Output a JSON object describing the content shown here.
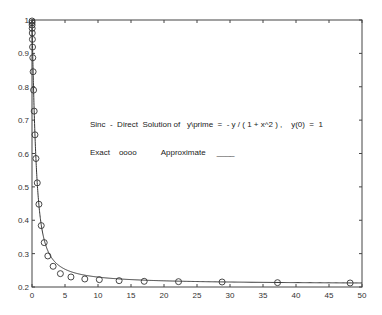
{
  "chart_data": {
    "type": "line",
    "title": "",
    "xlabel": "",
    "ylabel": "",
    "xlim": [
      0,
      50
    ],
    "ylim": [
      0.2,
      1
    ],
    "grid": false,
    "x_ticks": [
      "0",
      "5",
      "10",
      "15",
      "20",
      "25",
      "30",
      "35",
      "40",
      "45",
      "50"
    ],
    "y_ticks": [
      "0.2",
      "0.3",
      "0.4",
      "0.5",
      "0.6",
      "0.7",
      "0.8",
      "0.9",
      "1"
    ],
    "annotations": [
      {
        "text": "Sinc  -  Direct  Solution of   y\\prime  =  - y / ( 1 + x^2 ) ,    y(0)  =  1",
        "x": 7.5,
        "y": 0.72
      },
      {
        "text": "Exact    oooo           Approximate     ____",
        "x": 7.5,
        "y": 0.655
      }
    ],
    "series": [
      {
        "name": "Exact",
        "style": "markers-circle",
        "x": [
          0.003,
          0.008,
          0.015,
          0.025,
          0.04,
          0.06,
          0.085,
          0.12,
          0.17,
          0.24,
          0.33,
          0.45,
          0.6,
          0.8,
          1.05,
          1.4,
          1.85,
          2.4,
          3.2,
          4.3,
          5.9,
          8.0,
          10.2,
          13.2,
          17.0,
          22.2,
          28.8,
          37.2,
          48.2
        ],
        "y": [
          0.997,
          0.992,
          0.985,
          0.975,
          0.961,
          0.942,
          0.919,
          0.887,
          0.845,
          0.79,
          0.727,
          0.656,
          0.585,
          0.512,
          0.448,
          0.384,
          0.333,
          0.293,
          0.262,
          0.24,
          0.23,
          0.224,
          0.222,
          0.219,
          0.217,
          0.216,
          0.215,
          0.213,
          0.212
        ]
      },
      {
        "name": "Approximate",
        "style": "solid-line",
        "function": "exp(-atan(x))"
      }
    ]
  },
  "legend": {
    "title_line": "Sinc  -  Direct  Solution of   y\\prime  =  - y / ( 1 + x^2 ) ,    y(0)  =  1",
    "legend_line": "Exact    oooo           Approximate     ____"
  }
}
